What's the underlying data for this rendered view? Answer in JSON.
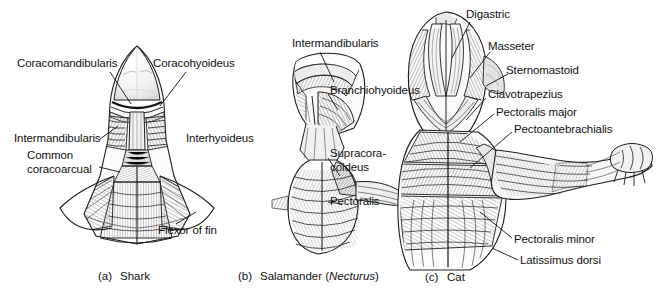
{
  "figure": {
    "background_color": "#ffffff",
    "ink_color": "#111111"
  },
  "panels": [
    {
      "id": "shark",
      "caption_tag": "(a)",
      "caption_text": "Shark",
      "labels": [
        {
          "name": "coracomandibularis",
          "text": "Coracomandibularis"
        },
        {
          "name": "coracohyoideus",
          "text": "Coracohyoideus"
        },
        {
          "name": "intermandibularis",
          "text": "Intermandibularis"
        },
        {
          "name": "interhyoideus",
          "text": "Interhyoideus"
        },
        {
          "name": "common-coracoarcual-line1",
          "text": "Common"
        },
        {
          "name": "common-coracoarcual-line2",
          "text": "coracoarcual"
        },
        {
          "name": "flexor-of-fin",
          "text": "Flexor of fin"
        }
      ]
    },
    {
      "id": "salamander",
      "caption_tag": "(b)",
      "caption_text_plain": "Salamander (Necturus)",
      "caption_prefix": "Salamander (",
      "caption_italic": "Necturus",
      "caption_suffix": ")",
      "labels": [
        {
          "name": "intermandibularis",
          "text": "Intermandibularis"
        },
        {
          "name": "branchiohyoideus",
          "text": "Branchiohyoideus"
        },
        {
          "name": "supracoracoideus-line1",
          "text": "Supracora-"
        },
        {
          "name": "supracoracoideus-line2",
          "text": "coideus"
        },
        {
          "name": "pectoralis",
          "text": "Pectoralis"
        }
      ]
    },
    {
      "id": "cat",
      "caption_tag": "(c)",
      "caption_text": "Cat",
      "labels": [
        {
          "name": "digastric",
          "text": "Digastric"
        },
        {
          "name": "masseter",
          "text": "Masseter"
        },
        {
          "name": "sternomastoid",
          "text": "Sternomastoid"
        },
        {
          "name": "clavotrapezius",
          "text": "Clavotrapezius"
        },
        {
          "name": "pectoralis-major",
          "text": "Pectoralis major"
        },
        {
          "name": "pectoantebrachialis",
          "text": "Pectoantebrachialis"
        },
        {
          "name": "pectoralis-minor",
          "text": "Pectoralis minor"
        },
        {
          "name": "latissimus-dorsi",
          "text": "Latissimus dorsi"
        }
      ]
    }
  ]
}
